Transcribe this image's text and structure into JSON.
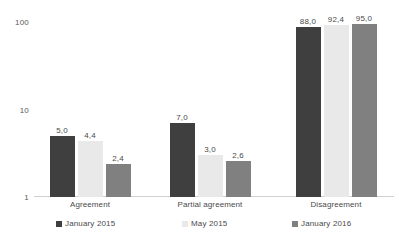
{
  "chart_data": {
    "type": "bar",
    "title": "",
    "subtitle": "",
    "xlabel": "",
    "ylabel": "",
    "yscale": "log",
    "ylim": [
      1,
      100
    ],
    "ytick_labels": [
      "100",
      "10",
      "1"
    ],
    "ytick_values": [
      100,
      10,
      1
    ],
    "grid": false,
    "legend_position": "bottom",
    "decimal_separator": ",",
    "categories": [
      "Agreement",
      "Partial agreement",
      "Disagreement"
    ],
    "series": [
      {
        "name": "January 2015",
        "color": "#3f3f3f",
        "values": [
          5.0,
          7.0,
          88.0
        ],
        "labels": [
          "5,0",
          "7,0",
          "88,0"
        ]
      },
      {
        "name": "May 2015",
        "color": "#e9e9e9",
        "values": [
          4.4,
          3.0,
          92.4
        ],
        "labels": [
          "4,4",
          "3,0",
          "92,4"
        ]
      },
      {
        "name": "January 2016",
        "color": "#808080",
        "values": [
          2.4,
          2.6,
          95.0
        ],
        "labels": [
          "2,4",
          "2,6",
          "95,0"
        ]
      }
    ]
  }
}
